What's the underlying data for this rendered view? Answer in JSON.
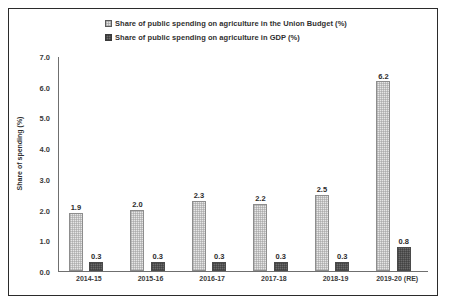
{
  "chart_data": {
    "type": "bar",
    "title": "",
    "subtitle": "",
    "xlabel": "",
    "ylabel": "Share of spending (%)",
    "ylim": [
      0.0,
      7.0
    ],
    "yticks": [
      "7.0",
      "6.0",
      "5.0",
      "4.0",
      "3.0",
      "2.0",
      "1.0",
      "0.0"
    ],
    "ytick_values": [
      7.0,
      6.0,
      5.0,
      4.0,
      3.0,
      2.0,
      1.0,
      0.0
    ],
    "grid": false,
    "legend_position": "top-center",
    "categories": [
      "2014-15",
      "2015-16",
      "2016-17",
      "2017-18",
      "2018-19",
      "2019-20 (RE)"
    ],
    "series": [
      {
        "name": "Share of public spending on agriculture in the Union Budget (%)",
        "color": "#e6e6e6",
        "values": [
          1.9,
          2.0,
          2.3,
          2.2,
          2.5,
          6.2
        ],
        "labels": [
          "1.9",
          "2.0",
          "2.3",
          "2.2",
          "2.5",
          "6.2"
        ]
      },
      {
        "name": "Share of public spending on agriculture in GDP (%)",
        "color": "#6b6b6b",
        "values": [
          0.3,
          0.3,
          0.3,
          0.3,
          0.3,
          0.8
        ],
        "labels": [
          "0.3",
          "0.3",
          "0.3",
          "0.3",
          "0.3",
          "0.8"
        ]
      }
    ]
  }
}
